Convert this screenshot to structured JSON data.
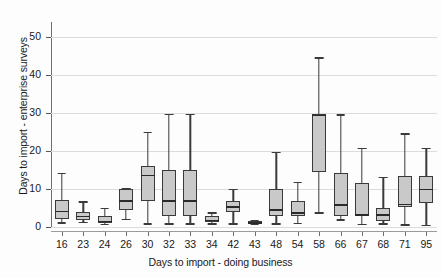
{
  "chart_data": {
    "type": "box",
    "title": "",
    "xlabel": "Days to import - doing business",
    "ylabel": "Days to import - enterprise surveys",
    "ylim": [
      0,
      54
    ],
    "yticks": [
      0,
      10,
      20,
      30,
      40,
      50
    ],
    "grid": true,
    "legend": null,
    "categories": [
      "16",
      "23",
      "24",
      "26",
      "30",
      "32",
      "33",
      "34",
      "42",
      "43",
      "48",
      "54",
      "58",
      "66",
      "67",
      "68",
      "71",
      "95"
    ],
    "boxes": [
      {
        "category": "16",
        "whisker_low": 1.2,
        "q1": 2.0,
        "median": 4.3,
        "q3": 7.2,
        "whisker_high": 14.2
      },
      {
        "category": "23",
        "whisker_low": 1.3,
        "q1": 1.9,
        "median": 3.0,
        "q3": 4.0,
        "whisker_high": 6.8
      },
      {
        "category": "24",
        "whisker_low": 0.9,
        "q1": 1.1,
        "median": 1.6,
        "q3": 3.0,
        "whisker_high": 5.0
      },
      {
        "category": "26",
        "whisker_low": 2.2,
        "q1": 4.5,
        "median": 7.0,
        "q3": 10.0,
        "whisker_high": 10.2
      },
      {
        "category": "30",
        "whisker_low": 1.0,
        "q1": 6.8,
        "median": 13.8,
        "q3": 16.1,
        "whisker_high": 25.1
      },
      {
        "category": "32",
        "whisker_low": 1.0,
        "q1": 2.9,
        "median": 7.0,
        "q3": 15.1,
        "whisker_high": 29.8
      },
      {
        "category": "33",
        "whisker_low": 1.0,
        "q1": 2.8,
        "median": 7.1,
        "q3": 15.1,
        "whisker_high": 29.8
      },
      {
        "category": "34",
        "whisker_low": 1.0,
        "q1": 1.3,
        "median": 1.9,
        "q3": 2.8,
        "whisker_high": 3.9
      },
      {
        "category": "42",
        "whisker_low": 1.0,
        "q1": 4.0,
        "median": 5.5,
        "q3": 6.9,
        "whisker_high": 10.0
      },
      {
        "category": "43",
        "whisker_low": 0.9,
        "q1": 1.0,
        "median": 1.3,
        "q3": 1.7,
        "whisker_high": 1.9
      },
      {
        "category": "48",
        "whisker_low": 1.0,
        "q1": 2.9,
        "median": 4.7,
        "q3": 10.0,
        "whisker_high": 19.8
      },
      {
        "category": "54",
        "whisker_low": 1.1,
        "q1": 2.8,
        "median": 3.9,
        "q3": 6.8,
        "whisker_high": 11.9
      },
      {
        "category": "58",
        "whisker_low": 3.9,
        "q1": 14.5,
        "median": 29.6,
        "q3": 29.8,
        "whisker_high": 44.7
      },
      {
        "category": "66",
        "whisker_low": 2.0,
        "q1": 3.0,
        "median": 6.0,
        "q3": 14.2,
        "whisker_high": 29.7
      },
      {
        "category": "67",
        "whisker_low": 0.9,
        "q1": 2.9,
        "median": 3.3,
        "q3": 11.5,
        "whisker_high": 20.9
      },
      {
        "category": "68",
        "whisker_low": 1.0,
        "q1": 1.7,
        "median": 3.4,
        "q3": 5.0,
        "whisker_high": 13.3
      },
      {
        "category": "71",
        "whisker_low": 0.7,
        "q1": 5.2,
        "median": 6.1,
        "q3": 13.5,
        "whisker_high": 24.7
      },
      {
        "category": "95",
        "whisker_low": 0.6,
        "q1": 6.4,
        "median": 10.1,
        "q3": 13.5,
        "whisker_high": 20.8
      }
    ]
  }
}
